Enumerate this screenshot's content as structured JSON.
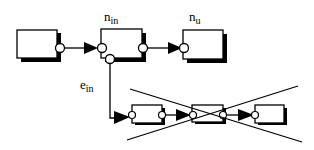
{
  "diagram": {
    "labels": {
      "n_in_base": "n",
      "n_in_sub": "in",
      "n_u_base": "n",
      "n_u_sub": "u",
      "e_in_base": "e",
      "e_in_sub": "in"
    },
    "colors": {
      "stroke": "#000000",
      "fill": "#ffffff",
      "shadow": "#000000"
    },
    "nodes": [
      {
        "id": "source",
        "label": ""
      },
      {
        "id": "n_in",
        "label": "n_in"
      },
      {
        "id": "n_u",
        "label": "n_u"
      },
      {
        "id": "sub_a",
        "label": ""
      },
      {
        "id": "sub_b",
        "label": "",
        "crossed_out": true
      },
      {
        "id": "sub_c",
        "label": ""
      }
    ],
    "edges": [
      {
        "from": "source",
        "to": "n_in"
      },
      {
        "from": "n_in",
        "to": "n_u"
      },
      {
        "from": "n_in",
        "to": "sub_a",
        "label": "e_in"
      },
      {
        "from": "sub_a",
        "to": "sub_b"
      },
      {
        "from": "sub_b",
        "to": "sub_c"
      }
    ]
  }
}
